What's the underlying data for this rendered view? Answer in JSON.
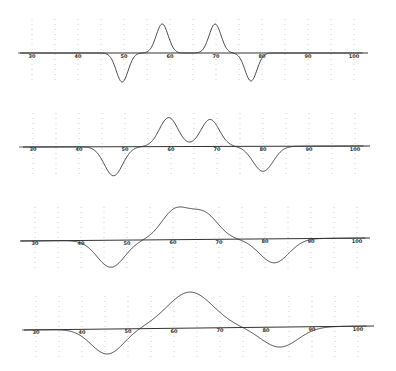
{
  "chart_data": [
    {
      "type": "line",
      "title": "",
      "xlabel": "",
      "ylabel": "",
      "x_ticks": [
        30,
        40,
        50,
        60,
        70,
        80,
        90,
        100
      ],
      "xlim": [
        27,
        103
      ],
      "grid": "dotted vertical every 5 units",
      "layout": {
        "baseline_y": 53,
        "x_left": 20,
        "x_right": 368,
        "px_at_30": 32,
        "px_per_unit": 4.6,
        "tilt": 0
      },
      "components": [
        {
          "center": 49.6,
          "amplitude": -29,
          "sigma": 1.3
        },
        {
          "center": 58.3,
          "amplitude": 29,
          "sigma": 1.3
        },
        {
          "center": 69.8,
          "amplitude": 29,
          "sigma": 1.3
        },
        {
          "center": 77.6,
          "amplitude": -28,
          "sigma": 1.3
        }
      ],
      "x": [
        30,
        40,
        45,
        48,
        49.6,
        51,
        53,
        55,
        57,
        58.3,
        60,
        62,
        64,
        66,
        68,
        69.8,
        71,
        73,
        75,
        77.6,
        80,
        85,
        90,
        100
      ],
      "y": [
        0,
        0,
        0,
        -14,
        -29,
        -16,
        -0.4,
        1,
        14,
        29,
        12,
        0.3,
        0,
        0.1,
        10,
        29,
        19,
        2,
        -4,
        -28,
        -5,
        0,
        0,
        0
      ]
    },
    {
      "type": "line",
      "title": "",
      "xlabel": "",
      "ylabel": "",
      "x_ticks": [
        30,
        40,
        50,
        60,
        70,
        80,
        90,
        100
      ],
      "xlim": [
        27,
        103
      ],
      "grid": "dotted vertical every 5 units",
      "layout": {
        "baseline_y": 147,
        "x_left": 23,
        "x_right": 370,
        "px_at_30": 33,
        "px_per_unit": 4.6,
        "tilt": -1
      },
      "components": [
        {
          "center": 47.5,
          "amplitude": -29,
          "sigma": 2.0
        },
        {
          "center": 59.5,
          "amplitude": 29,
          "sigma": 2.0
        },
        {
          "center": 68.5,
          "amplitude": 27,
          "sigma": 2.0
        },
        {
          "center": 80.0,
          "amplitude": -25,
          "sigma": 2.2
        }
      ],
      "x": [
        30,
        40,
        44,
        47.5,
        51,
        53,
        56,
        59.5,
        62,
        64,
        66,
        68.5,
        71,
        74,
        77,
        80,
        84,
        90,
        100
      ],
      "y": [
        0,
        0,
        -8,
        -29,
        -6,
        0.5,
        10,
        29,
        14,
        5,
        12,
        27,
        13,
        0,
        -10,
        -25,
        -4,
        0,
        0
      ]
    },
    {
      "type": "line",
      "title": "",
      "xlabel": "",
      "ylabel": "",
      "x_ticks": [
        30,
        40,
        50,
        60,
        70,
        80,
        90,
        100
      ],
      "xlim": [
        27,
        103
      ],
      "grid": "dotted vertical every 5 units",
      "layout": {
        "baseline_y": 241,
        "x_left": 20,
        "x_right": 370,
        "px_at_30": 35,
        "px_per_unit": 4.6,
        "tilt": -3
      },
      "components": [
        {
          "center": 46.5,
          "amplitude": -27,
          "sigma": 3.0
        },
        {
          "center": 60.5,
          "amplitude": 29,
          "sigma": 3.0
        },
        {
          "center": 66.8,
          "amplitude": 25,
          "sigma": 3.0
        },
        {
          "center": 82.0,
          "amplitude": -24,
          "sigma": 3.2
        }
      ],
      "x": [
        30,
        40,
        43,
        46.5,
        50,
        53,
        56,
        60.5,
        63,
        64.5,
        66.8,
        70,
        73,
        76,
        79,
        82,
        86,
        90,
        100
      ],
      "y": [
        0,
        -1,
        -12,
        -27,
        -14,
        0,
        13,
        30,
        25,
        23,
        26,
        14,
        2,
        -6,
        -17,
        -24,
        -8,
        -1,
        0
      ]
    },
    {
      "type": "line",
      "title": "",
      "xlabel": "",
      "ylabel": "",
      "x_ticks": [
        30,
        40,
        50,
        60,
        70,
        80,
        90,
        100
      ],
      "xlim": [
        27,
        103
      ],
      "grid": "dotted vertical every 5 units",
      "layout": {
        "baseline_y": 330,
        "x_left": 24,
        "x_right": 374,
        "px_at_30": 36,
        "px_per_unit": 4.6,
        "tilt": -4
      },
      "components": [
        {
          "center": 45.5,
          "amplitude": -25,
          "sigma": 3.5
        },
        {
          "center": 63.5,
          "amplitude": 36,
          "sigma": 5.0
        },
        {
          "center": 83.0,
          "amplitude": -20,
          "sigma": 4.0
        }
      ],
      "x": [
        30,
        35,
        40,
        45.5,
        50,
        54,
        58,
        63.5,
        68,
        72,
        76,
        79,
        83,
        87,
        90,
        100
      ],
      "y": [
        0,
        0,
        -4,
        -25,
        -12,
        3,
        22,
        36,
        22,
        6,
        -4,
        -12,
        -20,
        -8,
        -1,
        0
      ]
    }
  ]
}
